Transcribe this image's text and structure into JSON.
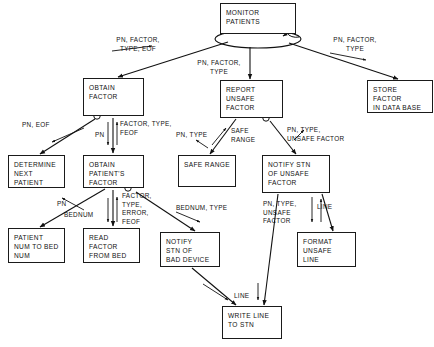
{
  "diagram": {
    "type": "structure-chart",
    "nodes": [
      {
        "id": "monitor-patients",
        "label": "MONITOR\nPATIENTS",
        "x": 220,
        "y": 3,
        "w": 76,
        "h": 31
      },
      {
        "id": "obtain-factor",
        "label": "OBTAIN\nFACTOR",
        "x": 83,
        "y": 78,
        "w": 61,
        "h": 38
      },
      {
        "id": "report-unsafe-factor",
        "label": "REPORT\nUNSAFE\nFACTOR",
        "x": 220,
        "y": 80,
        "w": 63,
        "h": 38
      },
      {
        "id": "store-factor-in-db",
        "label": "STORE\nFACTOR\nIN DATA BASE",
        "x": 367,
        "y": 80,
        "w": 66,
        "h": 33
      },
      {
        "id": "determine-next-patient",
        "label": "DETERMINE\nNEXT\nPATIENT",
        "x": 8,
        "y": 155,
        "w": 57,
        "h": 33
      },
      {
        "id": "obtain-patients-factor",
        "label": "OBTAIN\nPATIENT'S\nFACTOR",
        "x": 83,
        "y": 155,
        "w": 61,
        "h": 33
      },
      {
        "id": "safe-range",
        "label": "SAFE RANGE",
        "x": 178,
        "y": 155,
        "w": 58,
        "h": 32
      },
      {
        "id": "notify-stn-unsafe",
        "label": "NOTIFY STN\nOF UNSAFE\nFACTOR",
        "x": 262,
        "y": 155,
        "w": 68,
        "h": 38
      },
      {
        "id": "patient-num-to-bed-num",
        "label": "PATIENT\nNUM TO BED\nNUM",
        "x": 8,
        "y": 228,
        "w": 57,
        "h": 35
      },
      {
        "id": "read-factor-from-bed",
        "label": "READ\nFACTOR\nFROM BED",
        "x": 83,
        "y": 228,
        "w": 57,
        "h": 35
      },
      {
        "id": "notify-stn-bad-device",
        "label": "NOTIFY\nSTN OF\nBAD DEVICE",
        "x": 160,
        "y": 232,
        "w": 60,
        "h": 35
      },
      {
        "id": "format-unsafe-line",
        "label": "FORMAT\nUNSAFE\nLINE",
        "x": 297,
        "y": 232,
        "w": 59,
        "h": 35
      },
      {
        "id": "write-line-to-stn",
        "label": "WRITE LINE\nTO STN",
        "x": 222,
        "y": 306,
        "w": 60,
        "h": 33
      }
    ],
    "edge_labels": [
      {
        "id": "lbl-pn-factor-type-eof",
        "text": "PN, FACTOR,\nTYPE, EOF",
        "x": 107,
        "y": 36,
        "w": 62,
        "align": "center"
      },
      {
        "id": "lbl-pn-factor-type-mid",
        "text": "PN, FACTOR,\nTYPE",
        "x": 189,
        "y": 59,
        "w": 60,
        "align": "center"
      },
      {
        "id": "lbl-pn-factor-type-right",
        "text": "PN, FACTOR,\nTYPE",
        "x": 324,
        "y": 36,
        "w": 62,
        "align": "center"
      },
      {
        "id": "lbl-pn-eof",
        "text": "PN, EOF",
        "x": 22,
        "y": 121,
        "w": 36,
        "align": "left"
      },
      {
        "id": "lbl-pn-1",
        "text": "PN",
        "x": 95,
        "y": 131,
        "w": 14,
        "align": "left"
      },
      {
        "id": "lbl-factor-type-feof",
        "text": "FACTOR, TYPE,\nFEOF",
        "x": 117,
        "y": 120,
        "w": 66,
        "align": "left"
      },
      {
        "id": "lbl-pn-type",
        "text": "PN, TYPE",
        "x": 178,
        "y": 131,
        "w": 38,
        "align": "left"
      },
      {
        "id": "lbl-safe-range",
        "text": "SAFE\nRANGE",
        "x": 231,
        "y": 127,
        "w": 30,
        "align": "left"
      },
      {
        "id": "lbl-pn-type-unsafe-factor",
        "text": "PN, TYPE,\nUNSAFE FACTOR",
        "x": 287,
        "y": 126,
        "w": 72,
        "align": "left"
      },
      {
        "id": "lbl-pn-2",
        "text": "PN",
        "x": 57,
        "y": 200,
        "w": 14,
        "align": "left"
      },
      {
        "id": "lbl-bednum",
        "text": "BEDNUM",
        "x": 66,
        "y": 210,
        "w": 36,
        "align": "left"
      },
      {
        "id": "lbl-factor-type-error-feof",
        "text": "FACTOR,\nTYPE,\nERROR,\nFEOF",
        "x": 122,
        "y": 192,
        "w": 44,
        "align": "left"
      },
      {
        "id": "lbl-bednum-type",
        "text": "BEDNUM, TYPE",
        "x": 178,
        "y": 204,
        "w": 62,
        "align": "left"
      },
      {
        "id": "lbl-pn-type-unsafe-factor-2",
        "text": "PN, TYPE,\nUNSAFE\nFACTOR",
        "x": 263,
        "y": 200,
        "w": 44,
        "align": "left"
      },
      {
        "id": "lbl-line-right",
        "text": "LINE",
        "x": 317,
        "y": 203,
        "w": 22,
        "align": "left"
      },
      {
        "id": "lbl-line-bottom",
        "text": "LINE",
        "x": 234,
        "y": 292,
        "w": 22,
        "align": "left"
      }
    ]
  }
}
